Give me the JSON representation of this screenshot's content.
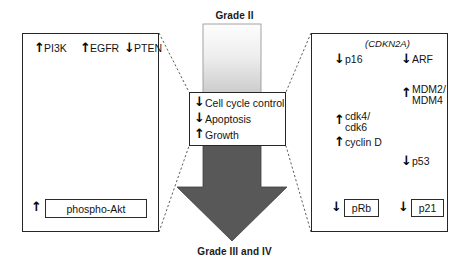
{
  "figure": {
    "top_label": "Grade II",
    "bottom_label": "Grade III and IV"
  },
  "colors": {
    "ink": "#131313",
    "box_border": "#262626",
    "gray_arrow": "#8a8a8a",
    "progression_arrow_dark": "#585858",
    "progression_gradient_top": "#fbfbfb",
    "progression_gradient_bottom": "#d0d0d0"
  },
  "glyphs": {
    "up": "↑",
    "down": "↓"
  },
  "left_panel": {
    "name": "pi3k-pathway-panel",
    "nodes": [
      {
        "label": "PI3K",
        "regulation": "up",
        "glyph": "↑"
      },
      {
        "label": "EGFR",
        "regulation": "up",
        "glyph": "↑"
      },
      {
        "label": "PTEN",
        "regulation": "down",
        "glyph": "↓"
      }
    ],
    "output": {
      "label": "phospho-Akt",
      "regulation": "up",
      "glyph": "↑"
    }
  },
  "center_panel": {
    "name": "cell-process-panel",
    "items": [
      {
        "label": "Cell cycle control",
        "regulation": "down",
        "glyph": "↓"
      },
      {
        "label": "Apoptosis",
        "regulation": "down",
        "glyph": "↓"
      },
      {
        "label": "Growth",
        "regulation": "up",
        "glyph": "↑"
      }
    ]
  },
  "right_panel": {
    "name": "cdkn2a-pathway-panel",
    "gene_label": "(CDKN2A)",
    "left_branch": {
      "nodes": [
        {
          "label": "p16",
          "regulation": "down",
          "glyph": "↓"
        },
        {
          "label_line1": "cdk4/",
          "label_line2": "cdk6",
          "regulation": "up",
          "glyph": "↑"
        },
        {
          "label": "cyclin D",
          "regulation": "up",
          "glyph": "↑"
        }
      ],
      "output": {
        "label": "pRb",
        "regulation": "down",
        "glyph": "↓"
      }
    },
    "right_branch": {
      "nodes": [
        {
          "label": "ARF",
          "regulation": "down",
          "glyph": "↓"
        },
        {
          "label_line1": "MDM2/",
          "label_line2": "MDM4",
          "regulation": "up",
          "glyph": "↑"
        },
        {
          "label": "p53",
          "regulation": "down",
          "glyph": "↓"
        }
      ],
      "output": {
        "label": "p21",
        "regulation": "down",
        "glyph": "↓"
      }
    }
  }
}
